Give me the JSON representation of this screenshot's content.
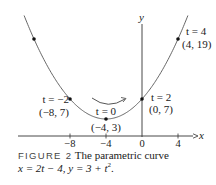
{
  "figure": {
    "label": "FIGURE 2",
    "caption_text": "The parametric curve",
    "caption_eq_1": "x = 2t − 4, y = 3 + t",
    "caption_eq_sup": "2",
    "caption_eq_end": "."
  },
  "axes": {
    "x_label": "x",
    "y_label": "y",
    "x_ticks": [
      "−8",
      "−4",
      "0",
      "4"
    ]
  },
  "points": [
    {
      "t_label": "t = −2",
      "coord_label": "(−8, 7)"
    },
    {
      "t_label": "t = 0",
      "coord_label": "(−4, 3)"
    },
    {
      "t_label": "t = 2",
      "coord_label": "(0, 7)"
    },
    {
      "t_label": "t = 4",
      "coord_label": "(4, 19)"
    }
  ],
  "chart_data": {
    "type": "line",
    "xlabel": "x",
    "ylabel": "y",
    "x_ticks": [
      -8,
      -4,
      0,
      4
    ],
    "xlim": [
      -14,
      6
    ],
    "ylim": [
      0,
      22
    ],
    "grid": false,
    "series": [
      {
        "name": "x = 2t − 4, y = 3 + t^2",
        "parametric": {
          "x": "2t - 4",
          "y": "3 + t^2"
        },
        "marked_points": [
          {
            "t": -4,
            "x": -12,
            "y": 19
          },
          {
            "t": -2,
            "x": -8,
            "y": 7
          },
          {
            "t": 0,
            "x": -4,
            "y": 3
          },
          {
            "t": 2,
            "x": 0,
            "y": 7
          },
          {
            "t": 4,
            "x": 4,
            "y": 19
          }
        ]
      }
    ],
    "annotations": [
      {
        "text": "t = −2 (−8, 7)"
      },
      {
        "text": "t = 0 (−4, 3)"
      },
      {
        "text": "t = 2 (0, 7)"
      },
      {
        "text": "t = 4 (4, 19)"
      },
      {
        "text": "direction arrow: increasing t, left to right"
      }
    ]
  }
}
